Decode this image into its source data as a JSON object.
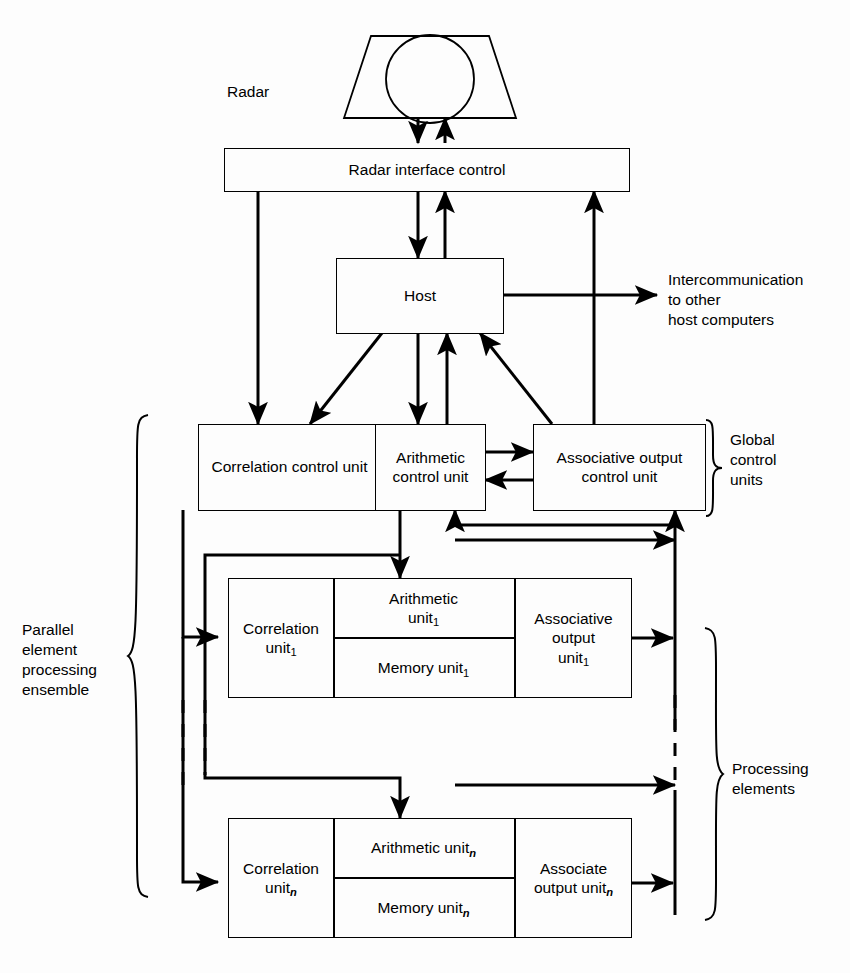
{
  "diagram": {
    "stroke_color": "#000000",
    "background_color": "#fdfdfd"
  },
  "labels": {
    "radar": "Radar",
    "intercommunication": "Intercommunication\nto other\nhost computers",
    "global_control_units": "Global\ncontrol\nunits",
    "parallel_element_processing_ensemble": "Parallel\nelement\nprocessing\nensemble",
    "processing_elements": "Processing\nelements"
  },
  "boxes": {
    "radar_interface_control": "Radar interface control",
    "host": "Host",
    "correlation_control_unit": "Correlation\ncontrol\nunit",
    "arithmetic_control_unit": "Arithmetic\ncontrol\nunit",
    "associative_output_control_unit": "Associative\noutput\ncontrol unit"
  },
  "processing_elements": [
    {
      "index": "1",
      "correlation_unit": "Correlation",
      "correlation_sub": "1",
      "arithmetic_unit": "Arithmetic",
      "arithmetic_sub": "1",
      "memory_unit": "Memory  unit",
      "memory_sub": "1",
      "output_unit_line1": "Associative",
      "output_unit_line2": "output",
      "output_unit_line3": "unit",
      "output_sub": "1",
      "unit_word": "unit"
    },
    {
      "index": "n",
      "correlation_unit": "Correlation",
      "correlation_sub": "n",
      "arithmetic_unit": "Arithmetic  unit",
      "arithmetic_sub": "n",
      "memory_unit": "Memory  unit",
      "memory_sub": "n",
      "output_unit_line1": "Associate",
      "output_unit_line2": "output unit",
      "output_unit_line3": "",
      "output_sub": "n",
      "unit_word": "unit"
    }
  ]
}
